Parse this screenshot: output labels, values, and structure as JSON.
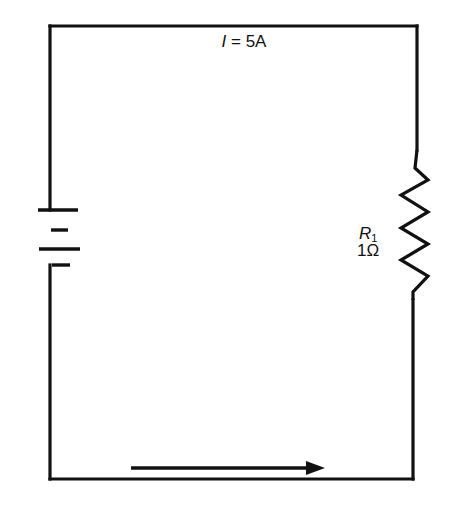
{
  "diagram": {
    "type": "circuit-schematic",
    "current_label": {
      "symbol": "I",
      "equals": " = ",
      "value": "5A"
    },
    "resistor": {
      "name_symbol": "R",
      "name_subscript": "1",
      "value": "1Ω"
    },
    "battery": {
      "cells": 2
    },
    "current_direction": "left-to-right along bottom wire",
    "colors": {
      "ink": "#111111",
      "background": "#ffffff"
    }
  }
}
